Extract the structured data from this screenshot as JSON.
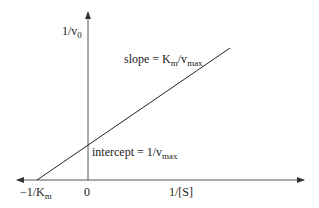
{
  "diagram": {
    "y_axis_label": "1/v",
    "y_axis_label_sub": "0",
    "x_axis_label": "1/[S]",
    "origin_label": "0",
    "x_intercept_label": "−1/K",
    "x_intercept_label_sub": "m",
    "slope_label_prefix": "slope = K",
    "slope_label_sub1": "m",
    "slope_label_mid": "/v",
    "slope_label_sub2": "max",
    "intercept_label_prefix": "intercept = 1/v",
    "intercept_label_sub": "max",
    "colors": {
      "axis": "#444444",
      "line": "#222222",
      "text": "#222222"
    }
  }
}
